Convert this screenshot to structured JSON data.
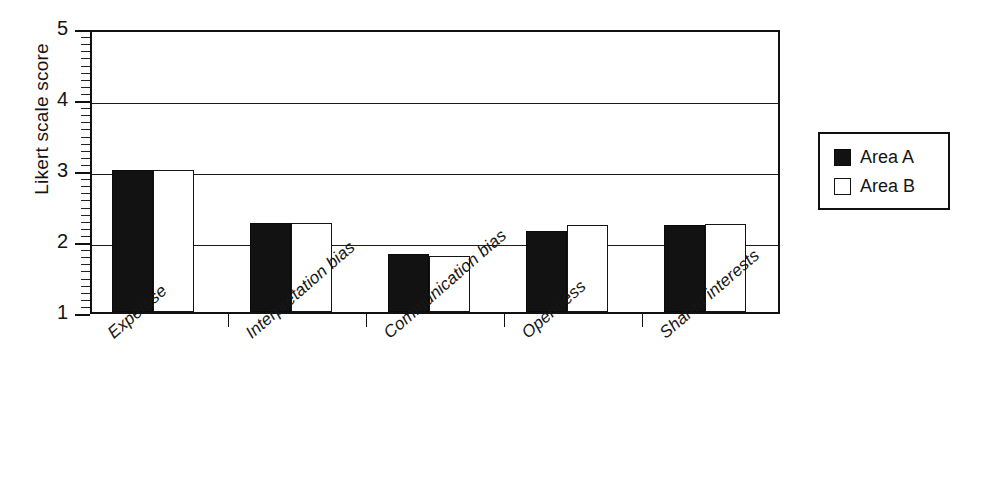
{
  "chart_data": {
    "type": "bar",
    "title": "",
    "xlabel": "",
    "ylabel": "Likert scale score",
    "ylim": [
      1,
      5
    ],
    "yticks": [
      1,
      2,
      3,
      4,
      5
    ],
    "ytick_labels": [
      "1",
      "2",
      "3",
      "4",
      "5"
    ],
    "minor_tick_step": 0.1,
    "grid": "horizontal",
    "legend_position": "right-outside",
    "categories": [
      "Expertise",
      "Interpretation bias",
      "Communication bias",
      "Openness",
      "Shared interests"
    ],
    "series": [
      {
        "name": "Area A",
        "color": "#121212",
        "fill": "solid-black",
        "values": [
          3.0,
          2.25,
          1.82,
          2.14,
          2.22
        ]
      },
      {
        "name": "Area B",
        "color": "#ffffff",
        "fill": "white-outlined",
        "values": [
          3.0,
          2.25,
          1.79,
          2.22,
          2.24
        ]
      }
    ]
  },
  "legend": {
    "entries": [
      {
        "label": "Area A",
        "swatch": "filled-black-square"
      },
      {
        "label": "Area B",
        "swatch": "open-white-square"
      }
    ]
  },
  "axes": {
    "y_title": "Likert scale score"
  }
}
